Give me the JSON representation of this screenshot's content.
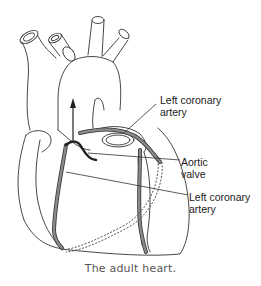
{
  "figure": {
    "caption": "The adult heart.",
    "labels": [
      {
        "id": "left-coronary-artery-top",
        "line1": "Left coronary",
        "line2": "artery"
      },
      {
        "id": "aortic-valve",
        "line1": "Aortic",
        "line2": "valve"
      },
      {
        "id": "left-coronary-artery-bottom",
        "line1": "Left coronary",
        "line2": "artery"
      }
    ],
    "colors": {
      "outline": "#333333",
      "artery_fill": "#8a8a8a",
      "background": "#ffffff"
    }
  }
}
